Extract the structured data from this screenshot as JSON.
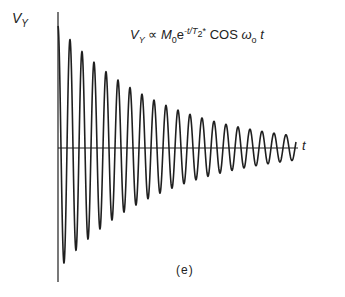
{
  "chart_data": {
    "type": "line",
    "xlabel": "t",
    "ylabel": "V_Y",
    "caption": "(e)",
    "function": "A * exp(-t/T2) * cos(w0 * t)",
    "params": {
      "initial_amplitude_px": 122,
      "decay_to_amplitude_px": 12,
      "cycles_visible": 20,
      "period_px": 12,
      "x_start_px": 58,
      "x_end_px": 296,
      "zero_line_y_px": 148
    },
    "envelope_peaks": [
      {
        "cycle": 0,
        "relative_amplitude": 1.0
      },
      {
        "cycle": 1,
        "relative_amplitude": 0.88
      },
      {
        "cycle": 2,
        "relative_amplitude": 0.78
      },
      {
        "cycle": 3,
        "relative_amplitude": 0.69
      },
      {
        "cycle": 4,
        "relative_amplitude": 0.61
      },
      {
        "cycle": 5,
        "relative_amplitude": 0.54
      },
      {
        "cycle": 6,
        "relative_amplitude": 0.48
      },
      {
        "cycle": 7,
        "relative_amplitude": 0.42
      },
      {
        "cycle": 8,
        "relative_amplitude": 0.37
      },
      {
        "cycle": 9,
        "relative_amplitude": 0.33
      },
      {
        "cycle": 10,
        "relative_amplitude": 0.29
      },
      {
        "cycle": 11,
        "relative_amplitude": 0.26
      },
      {
        "cycle": 12,
        "relative_amplitude": 0.23
      },
      {
        "cycle": 13,
        "relative_amplitude": 0.2
      },
      {
        "cycle": 14,
        "relative_amplitude": 0.18
      },
      {
        "cycle": 15,
        "relative_amplitude": 0.16
      },
      {
        "cycle": 16,
        "relative_amplitude": 0.14
      },
      {
        "cycle": 17,
        "relative_amplitude": 0.12
      },
      {
        "cycle": 18,
        "relative_amplitude": 0.11
      },
      {
        "cycle": 19,
        "relative_amplitude": 0.1
      }
    ],
    "grid": false,
    "legend": null
  },
  "labels": {
    "y_axis": "V",
    "y_axis_sub": "Y",
    "x_axis": "t",
    "formula_v": "V",
    "formula_v_sub": "Y",
    "formula_prop": " ∝ ",
    "formula_m": "M",
    "formula_m_sub": "0",
    "formula_e": "e",
    "formula_exp": "-t/T",
    "formula_exp_sub": "2",
    "formula_exp_star": "*",
    "formula_cos": " COS ",
    "formula_omega": "ω",
    "formula_omega_sub": "o",
    "formula_t": "t",
    "caption": "(e)"
  },
  "colors": {
    "line": "#1f1f1f",
    "axis": "#1f1f1f",
    "background": "#ffffff"
  }
}
